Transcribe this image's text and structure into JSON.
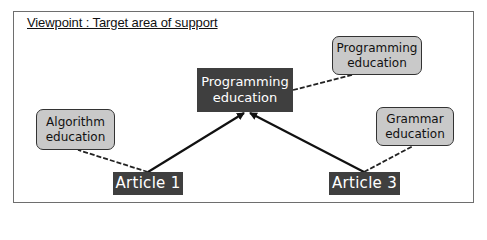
{
  "diagram": {
    "title": "Viewpoint : Target area of support",
    "center_node": {
      "line1": "Programming",
      "line2": "education"
    },
    "articles": [
      {
        "label": "Article 1"
      },
      {
        "label": "Article 3"
      }
    ],
    "tags": [
      {
        "id": "programming",
        "line1": "Programming",
        "line2": "education",
        "attached_to": "Article 3"
      },
      {
        "id": "algorithm",
        "line1": "Algorithm",
        "line2": "education",
        "attached_to": "Article 1"
      },
      {
        "id": "grammar",
        "line1": "Grammar",
        "line2": "education",
        "attached_to": "Article 3"
      }
    ],
    "edges": [
      {
        "from": "Article 1",
        "to": "Programming education (center)",
        "style": "solid-arrow"
      },
      {
        "from": "Article 3",
        "to": "Programming education (center)",
        "style": "solid-arrow"
      },
      {
        "from": "Article 1",
        "to": "Algorithm education",
        "style": "dashed"
      },
      {
        "from": "Article 3",
        "to": "Grammar education",
        "style": "dashed"
      },
      {
        "from": "Programming education (center)",
        "to": "Programming education (tag)",
        "style": "dashed"
      }
    ],
    "colors": {
      "dark_box": "#3f3f3f",
      "light_box": "#c9c9c9",
      "frame_border": "#6e6e6e",
      "line": "#111111"
    }
  }
}
